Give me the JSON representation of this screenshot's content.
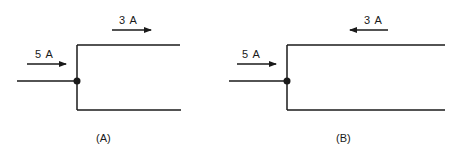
{
  "diagram": {
    "type": "circuit-junction",
    "panels": [
      {
        "id": "A",
        "caption": "(A)",
        "input_current": {
          "label": "5 A",
          "direction": "right"
        },
        "branch_current": {
          "label": "3 A",
          "direction": "right",
          "branch": "top"
        }
      },
      {
        "id": "B",
        "caption": "(B)",
        "input_current": {
          "label": "5 A",
          "direction": "right"
        },
        "branch_current": {
          "label": "3 A",
          "direction": "left",
          "branch": "top"
        }
      }
    ],
    "colors": {
      "line": "#1a1a1a",
      "background": "#ffffff"
    }
  }
}
